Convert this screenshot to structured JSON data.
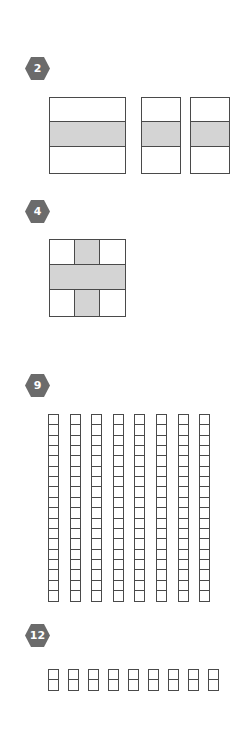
{
  "colors": {
    "badge": "#6b6b6b",
    "stroke": "#4a4a4a",
    "shade": "#d4d4d4"
  },
  "sections": [
    {
      "number": "2",
      "figure": "three rectangles each divided into 3 horizontal strips, middle strip shaded"
    },
    {
      "number": "4",
      "figure": "3x3 square with shaded cross (middle row and middle column)"
    },
    {
      "number": "9",
      "figure": "8 vertical columns of 18 unit squares"
    },
    {
      "number": "12",
      "figure": "9 vertical pairs of unit squares"
    }
  ],
  "grid9": {
    "columns": 8,
    "cells_per_column": 18
  },
  "grid12": {
    "units": 9,
    "cells_per_unit": 2
  }
}
